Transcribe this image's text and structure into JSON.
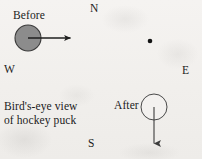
{
  "figure": {
    "title": "Bird's-eye view of hockey puck",
    "background_color": "#f3f1ef",
    "ink_color": "#1b1b1b",
    "width": 202,
    "height": 159
  },
  "caption": {
    "line1": "Bird's-eye view",
    "line2": "of hockey puck"
  },
  "compass": {
    "north": "N",
    "west": "W",
    "east": "E",
    "south": "S"
  },
  "before": {
    "label": "Before",
    "puck": {
      "shape": "filled-circle",
      "fill_color": "#8c8c8c",
      "stroke_color": "#3a3a3a",
      "center_x": 28,
      "center_y": 38,
      "radius": 13
    },
    "velocity_arrow": {
      "direction": "east",
      "from_x": 28,
      "from_y": 38,
      "to_x": 76,
      "to_y": 38
    }
  },
  "after": {
    "label": "After",
    "puck": {
      "shape": "open-circle",
      "fill_color": "#f3f1ef",
      "stroke_color": "#4a4a4a",
      "center_x": 154,
      "center_y": 107,
      "radius": 13
    },
    "velocity_arrow": {
      "direction": "south",
      "from_x": 154,
      "from_y": 107,
      "to_x": 154,
      "to_y": 151
    }
  },
  "reference_dot": {
    "name": "center-reference-dot",
    "color": "#141414",
    "center_x": 150,
    "center_y": 41,
    "radius": 2.3
  }
}
